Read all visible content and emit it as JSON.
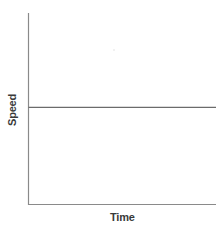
{
  "chart_data": {
    "type": "line",
    "title": "",
    "xlabel": "Time",
    "ylabel": "Speed",
    "x": [
      0,
      1
    ],
    "series": [
      {
        "name": "speed",
        "values": [
          0.5,
          0.5
        ]
      }
    ],
    "xlim": [
      0,
      1
    ],
    "ylim": [
      0,
      1
    ],
    "grid": false,
    "legend": null,
    "tick_labels": {
      "x": [],
      "y": []
    },
    "annotations": []
  },
  "colors": {
    "axis": "#8a8a8a",
    "series": "#6b6b6b",
    "label": "#3a3a3a",
    "background": "#ffffff"
  }
}
